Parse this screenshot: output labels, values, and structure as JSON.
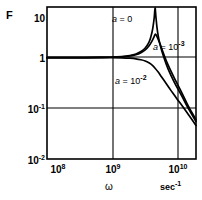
{
  "chart_data": {
    "type": "line",
    "title": "",
    "xlabel": "ω",
    "xunits": "sec⁻¹",
    "ylabel": "F",
    "xscale": "log",
    "yscale": "log",
    "xlim": [
      100000000.0,
      22000000000.0
    ],
    "ylim": [
      0.01,
      10
    ],
    "grid": true,
    "xticks": [
      {
        "value": 100000000.0,
        "label_mantissa": "10",
        "label_exponent": "8"
      },
      {
        "value": 1000000000.0,
        "label_mantissa": "10",
        "label_exponent": "9"
      },
      {
        "value": 10000000000.0,
        "label_mantissa": "10",
        "label_exponent": "10"
      }
    ],
    "yticks": [
      {
        "value": 10,
        "label_mantissa": "10",
        "label_exponent": ""
      },
      {
        "value": 1,
        "label_mantissa": "1",
        "label_exponent": ""
      },
      {
        "value": 0.1,
        "label_mantissa": "10",
        "label_exponent": "-1"
      },
      {
        "value": 0.01,
        "label_mantissa": "10",
        "label_exponent": "-2"
      }
    ],
    "legend_position": "inline-annotations",
    "series": [
      {
        "name": "a = 0",
        "annotation": "a = 0",
        "annotation_prefix": "a",
        "annotation_eq": "= 0",
        "points_xy": [
          [
            100000000.0,
            1.0
          ],
          [
            200000000.0,
            1.0
          ],
          [
            400000000.0,
            1.0
          ],
          [
            700000000.0,
            1.01
          ],
          [
            1000000000.0,
            1.02
          ],
          [
            1500000000.0,
            1.05
          ],
          [
            2000000000.0,
            1.1
          ],
          [
            2500000000.0,
            1.18
          ],
          [
            3000000000.0,
            1.32
          ],
          [
            3500000000.0,
            1.55
          ],
          [
            4000000000.0,
            2.0
          ],
          [
            4300000000.0,
            2.6
          ],
          [
            4600000000.0,
            3.8
          ],
          [
            4850000000.0,
            6.2
          ],
          [
            5000000000.0,
            9.6
          ],
          [
            5150000000.0,
            6.5
          ],
          [
            5350000000.0,
            4.0
          ],
          [
            5600000000.0,
            2.7
          ],
          [
            6000000000.0,
            1.8
          ],
          [
            6800000000.0,
            1.05
          ],
          [
            8000000000.0,
            0.6
          ],
          [
            10000000000.0,
            0.33
          ],
          [
            13000000000.0,
            0.18
          ],
          [
            17000000000.0,
            0.095
          ],
          [
            22000000000.0,
            0.055
          ]
        ]
      },
      {
        "name": "a = 10^-3",
        "annotation": "a = 10⁻³",
        "annotation_prefix": "a",
        "annotation_eq": "= 10",
        "annotation_exp": "-3",
        "points_xy": [
          [
            100000000.0,
            1.0
          ],
          [
            200000000.0,
            1.0
          ],
          [
            400000000.0,
            1.0
          ],
          [
            700000000.0,
            1.01
          ],
          [
            1000000000.0,
            1.02
          ],
          [
            1500000000.0,
            1.04
          ],
          [
            2000000000.0,
            1.08
          ],
          [
            2500000000.0,
            1.14
          ],
          [
            3000000000.0,
            1.25
          ],
          [
            3500000000.0,
            1.42
          ],
          [
            4000000000.0,
            1.7
          ],
          [
            4400000000.0,
            2.05
          ],
          [
            4800000000.0,
            2.55
          ],
          [
            5050000000.0,
            2.9
          ],
          [
            5300000000.0,
            2.7
          ],
          [
            5600000000.0,
            2.3
          ],
          [
            6000000000.0,
            1.85
          ],
          [
            6800000000.0,
            1.2
          ],
          [
            8000000000.0,
            0.72
          ],
          [
            10000000000.0,
            0.4
          ],
          [
            13000000000.0,
            0.21
          ],
          [
            17000000000.0,
            0.105
          ],
          [
            22000000000.0,
            0.06
          ]
        ]
      },
      {
        "name": "a = 10^-2",
        "annotation": "a = 10⁻²",
        "annotation_prefix": "a",
        "annotation_eq": "= 10",
        "annotation_exp": "-2",
        "points_xy": [
          [
            100000000.0,
            1.0
          ],
          [
            200000000.0,
            1.0
          ],
          [
            400000000.0,
            1.0
          ],
          [
            700000000.0,
            1.0
          ],
          [
            1000000000.0,
            1.0
          ],
          [
            1500000000.0,
            0.99
          ],
          [
            2000000000.0,
            0.975
          ],
          [
            2500000000.0,
            0.95
          ],
          [
            3000000000.0,
            0.91
          ],
          [
            3500000000.0,
            0.86
          ],
          [
            4000000000.0,
            0.79
          ],
          [
            4500000000.0,
            0.71
          ],
          [
            5000000000.0,
            0.62
          ],
          [
            5600000000.0,
            0.52
          ],
          [
            6300000000.0,
            0.42
          ],
          [
            7200000000.0,
            0.33
          ],
          [
            8200000000.0,
            0.26
          ],
          [
            9500000000.0,
            0.2
          ],
          [
            11000000000.0,
            0.155
          ],
          [
            13500000000.0,
            0.11
          ],
          [
            17000000000.0,
            0.073
          ],
          [
            22000000000.0,
            0.046
          ]
        ]
      }
    ]
  },
  "axis": {
    "y_title": "F",
    "x_title": "ω",
    "x_units_base": "sec",
    "x_units_exp": "-1"
  }
}
